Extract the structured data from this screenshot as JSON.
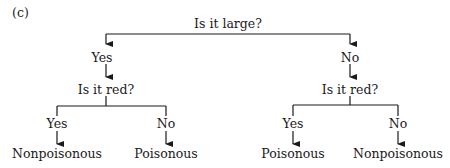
{
  "panel_label": "(c)",
  "tree": {
    "root": {
      "question": "Is it large?",
      "branches": [
        {
          "label": "Yes",
          "node": {
            "question": "Is it red?",
            "branches": [
              {
                "label": "Yes",
                "leaf": "Nonpoisonous"
              },
              {
                "label": "No",
                "leaf": "Poisonous"
              }
            ]
          }
        },
        {
          "label": "No",
          "node": {
            "question": "Is it red?",
            "branches": [
              {
                "label": "Yes",
                "leaf": "Poisonous"
              },
              {
                "label": "No",
                "leaf": "Nonpoisonous"
              }
            ]
          }
        }
      ]
    }
  },
  "colors": {
    "line": "#1a1a1a",
    "text": "#1a1a1a",
    "background": "#ffffff"
  }
}
